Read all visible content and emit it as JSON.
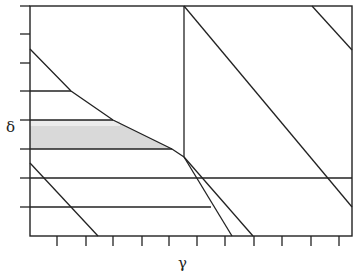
{
  "chart_data": {
    "type": "diagram",
    "title": "",
    "xlabel": "γ",
    "ylabel": "δ",
    "frame": {
      "x0": 30,
      "y0": 6,
      "x1": 352,
      "y1": 236
    },
    "x_ticks_px": [
      57,
      86,
      113,
      142,
      169,
      197,
      225,
      254,
      282,
      311,
      339
    ],
    "y_ticks_px": [
      6,
      34,
      63,
      91,
      120,
      149,
      178,
      207
    ],
    "tick_labels": "none",
    "shaded_region": {
      "fill": "#d9d9d9",
      "points": [
        [
          30,
          120
        ],
        [
          113,
          120
        ],
        [
          172,
          149
        ],
        [
          30,
          149
        ]
      ]
    },
    "curve": [
      [
        30,
        49
      ],
      [
        71,
        91
      ],
      [
        113,
        120
      ],
      [
        172,
        149
      ],
      [
        184,
        157
      ]
    ],
    "segments": [
      {
        "name": "vertical-divider",
        "from": [
          184,
          6
        ],
        "to": [
          184,
          157
        ]
      },
      {
        "name": "long-diagonal",
        "from": [
          184,
          6
        ],
        "to": [
          352,
          207
        ]
      },
      {
        "name": "top-right-diagonal",
        "from": [
          312,
          6
        ],
        "to": [
          352,
          50
        ]
      },
      {
        "name": "lower-left-diagonal",
        "from": [
          30,
          163
        ],
        "to": [
          98,
          236
        ]
      },
      {
        "name": "kink-branch-a",
        "from": [
          184,
          157
        ],
        "to": [
          232,
          236
        ]
      },
      {
        "name": "kink-branch-b",
        "from": [
          184,
          157
        ],
        "to": [
          253,
          236
        ]
      },
      {
        "name": "hline-91",
        "from": [
          30,
          91
        ],
        "to": [
          71,
          91
        ]
      },
      {
        "name": "hline-120",
        "from": [
          30,
          120
        ],
        "to": [
          113,
          120
        ]
      },
      {
        "name": "hline-149",
        "from": [
          30,
          149
        ],
        "to": [
          172,
          149
        ]
      },
      {
        "name": "hline-178",
        "from": [
          30,
          178
        ],
        "to": [
          352,
          178
        ]
      },
      {
        "name": "hline-207",
        "from": [
          30,
          207
        ],
        "to": [
          211,
          207
        ]
      }
    ],
    "line_color": "#222222"
  },
  "labels": {
    "x": "γ",
    "y": "δ"
  }
}
